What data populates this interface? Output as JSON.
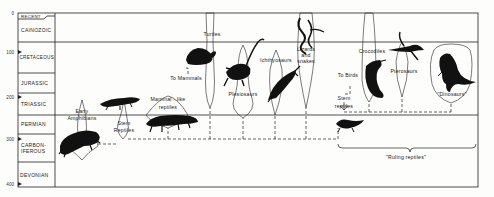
{
  "timescale": {
    "ticks": [
      {
        "label": "0",
        "y": 13
      },
      {
        "label": "100",
        "y": 52
      },
      {
        "label": "200",
        "y": 97
      },
      {
        "label": "300",
        "y": 139
      },
      {
        "label": "400",
        "y": 184
      }
    ],
    "periods": [
      {
        "name": "RECENT",
        "y": 16.5
      },
      {
        "name": "CAINOZOIC",
        "y": 31
      },
      {
        "name": "CRETACEOUS",
        "y": 58
      },
      {
        "name": "JURASSIC",
        "y": 84
      },
      {
        "name": "TRIASSIC",
        "y": 105
      },
      {
        "name": "PERMIAN",
        "y": 125
      },
      {
        "name": "CARBON-",
        "y": 146
      },
      {
        "name": "IFEROUS",
        "y": 152
      },
      {
        "name": "DEVONIAN",
        "y": 176
      }
    ]
  },
  "labels": {
    "early_amphibians_1": "Early",
    "early_amphibians_2": "Amphibians",
    "stem_reptiles_left_1": "Stem",
    "stem_reptiles_left_2": "Reptiles",
    "mammal_like_1": "Mammal - like",
    "mammal_like_2": "reptiles",
    "to_mammals": "To Mammals",
    "turtles": "Turtles",
    "plesiosaurs": "Plesiosaurs",
    "ichthyosaurs": "Ichthyosaurs",
    "lizards_1": "Lizards",
    "lizards_2": "and",
    "lizards_3": "snakes",
    "to_birds": "To Birds",
    "stem_reptiles_right_1": "Stem",
    "stem_reptiles_right_2": "reptiles",
    "crocodiles": "Crocodiles",
    "pterosaurs": "Pterosaurs",
    "dinosaurs": "\"Dinosaurs\"",
    "ruling_reptiles": "\"Ruling reptiles\""
  }
}
